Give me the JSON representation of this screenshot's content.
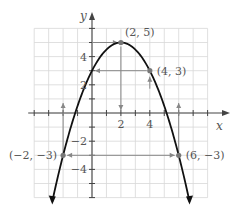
{
  "chart_data": {
    "type": "line",
    "title": "",
    "xlabel": "x",
    "ylabel": "y",
    "xlim": [
      -4,
      8
    ],
    "ylim": [
      -6,
      6
    ],
    "grid": true,
    "x_ticks": [
      2,
      4
    ],
    "y_ticks": [
      -4,
      -2,
      2,
      4
    ],
    "curve": {
      "description": "downward parabola y = -(x-2)^2 + 5",
      "a": -0.5,
      "vertex": [
        2,
        5
      ],
      "x_range": [
        -2.75,
        6.75
      ]
    },
    "points": [
      {
        "x": 2,
        "y": 5,
        "label": "(2, 5)"
      },
      {
        "x": 4,
        "y": 3,
        "label": "(4, 3)"
      },
      {
        "x": -2,
        "y": -3,
        "label": "(−2, −3)"
      },
      {
        "x": 6,
        "y": -3,
        "label": "(6, −3)"
      }
    ],
    "annotations": [
      "horizontal arrow from y-axis to (2, 5)",
      "horizontal arrow from (4, 3) toward y-axis at y=3",
      "vertical arrow from (4, 3) region up",
      "vertical arrow at x=2 pointing down to x-axis",
      "double-headed horizontal arrow between (-2, -3) and (6, -3)",
      "vertical arrows from x-axis down at x=-2 and x=6"
    ]
  },
  "axis_labels": {
    "x": "x",
    "y": "y"
  },
  "tick_labels": {
    "x": [
      "2",
      "4"
    ],
    "y": [
      "4",
      "2",
      "−2",
      "−4"
    ]
  },
  "point_labels": [
    "(2, 5)",
    "(4, 3)",
    "(−2, −3)",
    "(6, −3)"
  ],
  "colors": {
    "grid": "#d8d8d8",
    "axis": "#444444",
    "curve": "#111111",
    "point": "#777777",
    "annotation": "#888888"
  }
}
